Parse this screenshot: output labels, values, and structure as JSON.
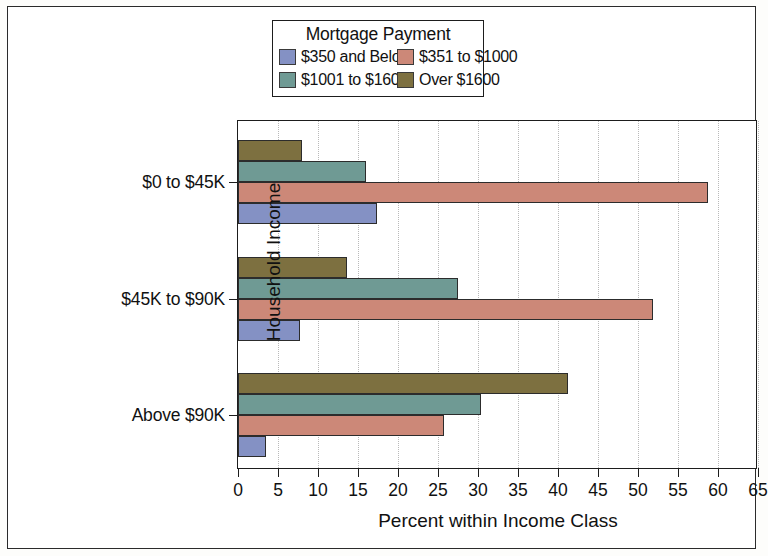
{
  "chart_data": {
    "type": "bar",
    "orientation": "horizontal",
    "title": "",
    "xlabel": "Percent within Income Class",
    "ylabel": "Household Income",
    "legend_title": "Mortgage Payment",
    "legend_position": "top",
    "grid": true,
    "xlim": [
      0,
      65
    ],
    "xticks": [
      0,
      5,
      10,
      15,
      20,
      25,
      30,
      35,
      40,
      45,
      50,
      55,
      60,
      65
    ],
    "xtick_labels": [
      "0",
      "5",
      "10",
      "15",
      "20",
      "25",
      "30",
      "35",
      "40",
      "45",
      "50",
      "55",
      "60",
      "65"
    ],
    "categories": [
      "$0 to $45K",
      "$45K to $90K",
      "Above $90K"
    ],
    "series": [
      {
        "name": "$350 and Below",
        "color": "#8491c4",
        "values": [
          17.4,
          7.7,
          3.5
        ]
      },
      {
        "name": "$351 to $1000",
        "color": "#cc8878",
        "values": [
          58.8,
          51.9,
          25.8
        ]
      },
      {
        "name": "$1001 to $1600",
        "color": "#6f9a94",
        "values": [
          16.0,
          27.5,
          30.4
        ]
      },
      {
        "name": "Over $1600",
        "color": "#7d7040",
        "values": [
          8.0,
          13.6,
          41.2
        ]
      }
    ]
  },
  "colors": {
    "axis": "#1d1d1d",
    "grid": "#b9b9b9",
    "background": "#ffffff",
    "text": "#111111"
  }
}
